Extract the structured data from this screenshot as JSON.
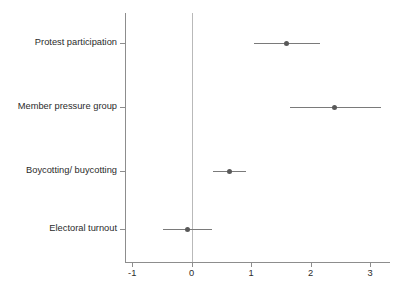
{
  "chart_data": {
    "type": "scatter",
    "title": "",
    "subtitle": "",
    "xlabel": "",
    "ylabel": "",
    "xlim": [
      -1.3,
      3.35
    ],
    "ylim": [
      0,
      4
    ],
    "grid": false,
    "legend": null,
    "orientation": "horizontal",
    "style": "coefficient plot with 95% confidence intervals",
    "reference_line": 0,
    "xticks": [
      -1,
      0,
      1,
      2,
      3
    ],
    "xtick_labels": [
      "-1",
      "0",
      "1",
      "2",
      "3"
    ],
    "categories": [
      "Protest participation",
      "Member pressure group",
      "Boycotting/ buycotting",
      "Electoral turnout"
    ],
    "values": [
      1.6,
      2.4,
      0.64,
      -0.07
    ],
    "ci_low": [
      1.05,
      1.65,
      0.35,
      -0.49
    ],
    "ci_high": [
      2.15,
      3.18,
      0.92,
      0.34
    ],
    "points": [
      {
        "category": "Protest participation",
        "estimate": 1.6,
        "ci_low": 1.05,
        "ci_high": 2.15
      },
      {
        "category": "Member pressure group",
        "estimate": 2.4,
        "ci_low": 1.65,
        "ci_high": 3.18
      },
      {
        "category": "Boycotting/ buycotting",
        "estimate": 0.64,
        "ci_low": 0.35,
        "ci_high": 0.92
      },
      {
        "category": "Electoral turnout",
        "estimate": -0.07,
        "ci_low": -0.49,
        "ci_high": 0.34
      }
    ],
    "colors": {
      "marker": "#595959",
      "interval": "#7a7a7a",
      "axis": "#8d8d8d",
      "reference": "#b9b9b9",
      "text": "#2b2b2b",
      "background": "#ffffff"
    }
  }
}
